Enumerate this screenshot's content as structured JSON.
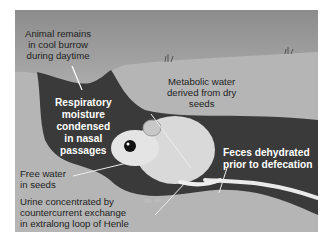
{
  "figure": {
    "colors": {
      "sky_top": "#8f8f8f",
      "sky_bottom": "#e6e6e6",
      "soil": "#b5b5b5",
      "burrow": "#3a3a3a",
      "label_dark": "#222222",
      "label_light": "#ffffff"
    },
    "labels": {
      "burrow_daytime": [
        "Animal remains",
        "in cool burrow",
        "during daytime"
      ],
      "respiratory": [
        "Respiratory",
        "moisture",
        "condensed",
        "in nasal",
        "passages"
      ],
      "metabolic": [
        "Metabolic water",
        "derived from dry",
        "seeds"
      ],
      "feces": [
        "Feces dehydrated",
        "prior to defecation"
      ],
      "free_water": [
        "Free water",
        "in seeds"
      ],
      "urine": [
        "Urine concentrated by",
        "countercurrent exchange",
        "in extralong loop of Henle"
      ]
    }
  }
}
